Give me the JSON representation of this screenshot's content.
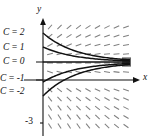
{
  "figure": {
    "kind": "slope-field-with-solution-curves",
    "axes": {
      "x_label": "x",
      "y_label": "y",
      "y_tick_labels": [
        "-3"
      ],
      "x_tick_labels": [],
      "origin_px": [
        43,
        80
      ]
    },
    "curve_labels": [
      {
        "text": "C = 2",
        "y_px": 33
      },
      {
        "text": "C = 1",
        "y_px": 48
      },
      {
        "text": "C = 0",
        "y_px": 62
      },
      {
        "text": "C = -1",
        "y_px": 80
      },
      {
        "text": "C = -2",
        "y_px": 92
      }
    ],
    "colors": {
      "axis": "#111111",
      "curve": "#1a1a1a",
      "slope_dash": "#7a7a7a",
      "background": "#ffffff"
    }
  },
  "chart_data": {
    "type": "line",
    "title": "",
    "xlabel": "x",
    "ylabel": "y",
    "xlim": [
      -0.3,
      4.2
    ],
    "ylim": [
      -3.6,
      2.6
    ],
    "grid": false,
    "legend": "inline-left-labels",
    "series": [
      {
        "name": "C = 2",
        "C": 2,
        "y_intercept": 2,
        "asymptote": 0.5
      },
      {
        "name": "C = 1",
        "C": 1,
        "y_intercept": 1.1,
        "asymptote": 0.5
      },
      {
        "name": "C = 0",
        "C": 0,
        "y_intercept": 0.5,
        "asymptote": 0.5
      },
      {
        "name": "C = -1",
        "C": -1,
        "y_intercept": -0.1,
        "asymptote": 0.5
      },
      {
        "name": "C = -2",
        "C": -2,
        "y_intercept": -1.0,
        "asymptote": 0.5
      }
    ],
    "slope_field": {
      "description": "short dashes; negative slope above the asymptote, positive slope below, flattening toward the right",
      "x_start": 50,
      "x_step": 9.5,
      "x_count": 10,
      "y_start": 27,
      "y_step": 9.0,
      "y_count": 12,
      "dash_length": 6
    }
  }
}
